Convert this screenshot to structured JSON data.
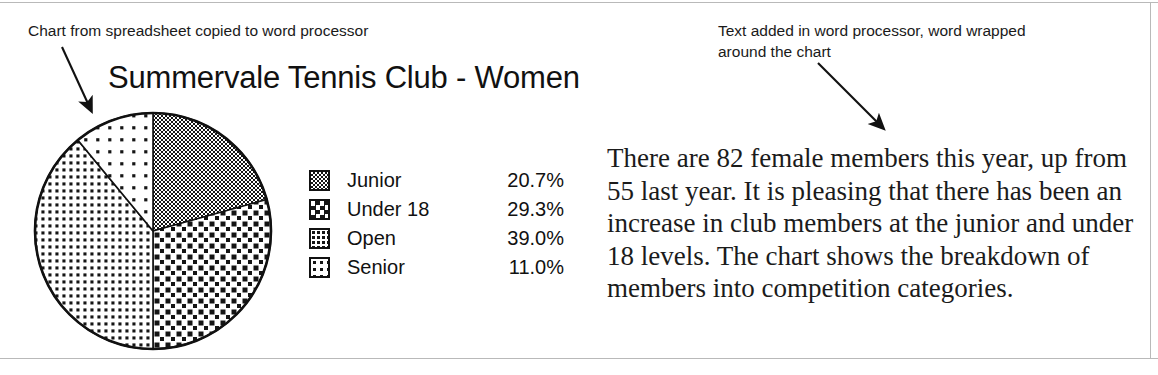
{
  "document": {
    "annotations": {
      "left": "Chart from spreadsheet copied to word processor",
      "right": "Text added in word processor, word wrapped\naround the chart"
    },
    "body_text": "There are 82 female members this year, up from 55 last year. It is pleasing that there has been an increase in club members at the junior and under 18 levels. The chart shows the breakdown of members into competition categories."
  },
  "chart_data": {
    "type": "pie",
    "title": "Summervale Tennis Club - Women",
    "categories": [
      "Junior",
      "Under 18",
      "Open",
      "Senior"
    ],
    "values": [
      20.7,
      29.3,
      39.0,
      11.0
    ],
    "value_labels": [
      "20.7%",
      "29.3%",
      "39.0%",
      "11.0%"
    ],
    "unit": "%",
    "start_angle": 0,
    "direction": "clockwise",
    "legend_position": "right",
    "grid": false,
    "slice_patterns": [
      "fine-checker",
      "bold-checker",
      "medium-dots",
      "sparse-dots"
    ],
    "outline_color": "#111111"
  }
}
